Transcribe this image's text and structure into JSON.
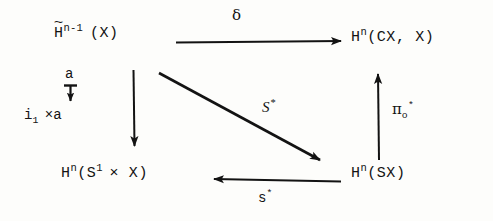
{
  "figure": {
    "kind": "commutative-diagram",
    "background_color": "#fdfdfb",
    "ink_color": "#131313"
  },
  "nodes": {
    "top_left": {
      "name": "reduced-cohomology-X",
      "base": "H",
      "accent": "~",
      "superscript": "n-1",
      "argument": "(X)",
      "plain_text": "H~^n-1 (X)"
    },
    "top_right": {
      "name": "relative-cohomology-cone",
      "base": "H",
      "superscript": "n",
      "argument": "(CX, X)",
      "plain_text": "H^n(CX, X)"
    },
    "bottom_left": {
      "name": "cohomology-circle-product",
      "base": "H",
      "superscript": "n",
      "argument_pre": "(S",
      "argument_sup": "1",
      "argument_post": "× X)",
      "plain_text": "H^n(S^1 x X)"
    },
    "bottom_right": {
      "name": "cohomology-suspension",
      "base": "H",
      "superscript": "n",
      "argument": "(SX)",
      "plain_text": "H^n(SX)"
    }
  },
  "arrow_labels": {
    "top": {
      "name": "delta",
      "text": "δ"
    },
    "diagonal": {
      "name": "S-star",
      "base": "S",
      "superscript": "*",
      "plain_text": "S*"
    },
    "bottom": {
      "name": "s-star",
      "base": "s",
      "superscript": "*",
      "plain_text": "s*"
    },
    "right": {
      "name": "pi-zero-star",
      "base": "π",
      "subscript": "o",
      "superscript": "*",
      "plain_text": "π_o^*"
    },
    "side_top": {
      "name": "a-label",
      "text": "a"
    },
    "side_bottom": {
      "name": "i1-cross-a-label",
      "base": "i",
      "subscript": "1",
      "rest": "×a",
      "plain_text": "i_1 ×a"
    }
  },
  "arrows": [
    {
      "name": "top-arrow-delta",
      "from": "top_left",
      "to": "top_right",
      "direction": "right"
    },
    {
      "name": "left-arrow-down",
      "from": "top_left",
      "to": "bottom_left",
      "direction": "down"
    },
    {
      "name": "right-arrow-up",
      "from": "bottom_right",
      "to": "top_right",
      "direction": "up"
    },
    {
      "name": "bottom-arrow-left",
      "from": "bottom_right",
      "to": "bottom_left",
      "direction": "left"
    },
    {
      "name": "diagonal-arrow",
      "from": "top_left",
      "to": "bottom_right",
      "direction": "down-right"
    },
    {
      "name": "side-annotation-arrow",
      "from": "side_top",
      "to": "side_bottom",
      "direction": "down"
    }
  ]
}
